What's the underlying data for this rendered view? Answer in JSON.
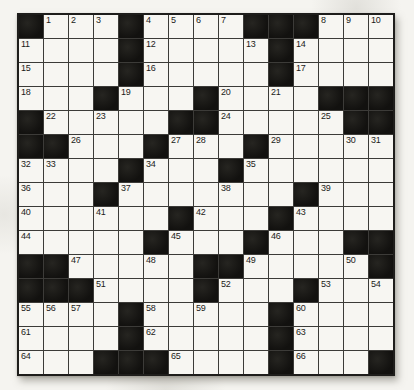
{
  "puzzle": {
    "kind": "crossword",
    "rows": 15,
    "cols": 15,
    "black_symbol": "#",
    "first_number": "1",
    "last_number": "66",
    "grid": [
      [
        "#",
        "1",
        "2",
        "3",
        "#",
        "4",
        "5",
        "6",
        "7",
        "#",
        "#",
        "#",
        "8",
        "9",
        "10"
      ],
      [
        "11",
        "",
        "",
        "",
        "#",
        "12",
        "",
        "",
        "",
        "13",
        "#",
        "14",
        "",
        "",
        ""
      ],
      [
        "15",
        "",
        "",
        "",
        "#",
        "16",
        "",
        "",
        "",
        "",
        "#",
        "17",
        "",
        "",
        ""
      ],
      [
        "18",
        "",
        "",
        "#",
        "19",
        "",
        "",
        "#",
        "20",
        "",
        "21",
        "",
        "#",
        "#",
        "#"
      ],
      [
        "#",
        "22",
        "",
        "23",
        "",
        "",
        "#",
        "#",
        "24",
        "",
        "",
        "",
        "25",
        "#",
        "#"
      ],
      [
        "#",
        "#",
        "26",
        "",
        "",
        "#",
        "27",
        "28",
        "",
        "#",
        "29",
        "",
        "",
        "30",
        "31"
      ],
      [
        "32",
        "33",
        "",
        "",
        "#",
        "34",
        "",
        "",
        "#",
        "35",
        "",
        "",
        "",
        "",
        ""
      ],
      [
        "36",
        "",
        "",
        "#",
        "37",
        "",
        "",
        "",
        "38",
        "",
        "",
        "#",
        "39",
        "",
        ""
      ],
      [
        "40",
        "",
        "",
        "41",
        "",
        "",
        "#",
        "42",
        "",
        "",
        "#",
        "43",
        "",
        "",
        ""
      ],
      [
        "44",
        "",
        "",
        "",
        "",
        "#",
        "45",
        "",
        "",
        "#",
        "46",
        "",
        "",
        "#",
        "#"
      ],
      [
        "#",
        "#",
        "47",
        "",
        "",
        "48",
        "",
        "#",
        "#",
        "49",
        "",
        "",
        "",
        "50",
        "#"
      ],
      [
        "#",
        "#",
        "#",
        "51",
        "",
        "",
        "",
        "#",
        "52",
        "",
        "",
        "#",
        "53",
        "",
        "54"
      ],
      [
        "55",
        "56",
        "57",
        "",
        "#",
        "58",
        "",
        "59",
        "",
        "",
        "#",
        "60",
        "",
        "",
        ""
      ],
      [
        "61",
        "",
        "",
        "",
        "#",
        "62",
        "",
        "",
        "",
        "",
        "#",
        "63",
        "",
        "",
        ""
      ],
      [
        "64",
        "",
        "",
        "#",
        "#",
        "#",
        "65",
        "",
        "",
        "",
        "#",
        "66",
        "",
        "",
        "#"
      ]
    ]
  },
  "colors": {
    "background": "#f5f4f0",
    "white_cell": "#f7f6f2",
    "black_cell": "#141311",
    "grid_line": "#3c3b38",
    "outer_border": "#1e1d1b",
    "number_text": "#1c1b19"
  }
}
